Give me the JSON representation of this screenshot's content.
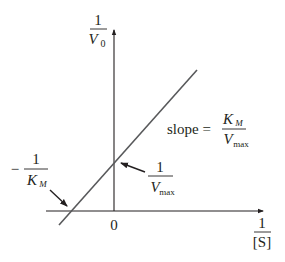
{
  "colors": {
    "axis": "#231f20",
    "line": "#58595b",
    "text": "#231f20"
  },
  "y_axis": {
    "numerator": "1",
    "denominator_var": "V",
    "denominator_sub": "0"
  },
  "x_axis": {
    "numerator": "1",
    "denominator": "[S]",
    "origin_label": "0"
  },
  "slope_label": {
    "prefix": "slope =",
    "numerator_var": "K",
    "numerator_sub": "M",
    "denominator_var": "V",
    "denominator_sub": "max"
  },
  "y_intercept_label": {
    "numerator": "1",
    "denominator_var": "V",
    "denominator_sub": "max"
  },
  "x_intercept_label": {
    "sign": "−",
    "numerator": "1",
    "denominator_var": "K",
    "denominator_sub": "M"
  }
}
